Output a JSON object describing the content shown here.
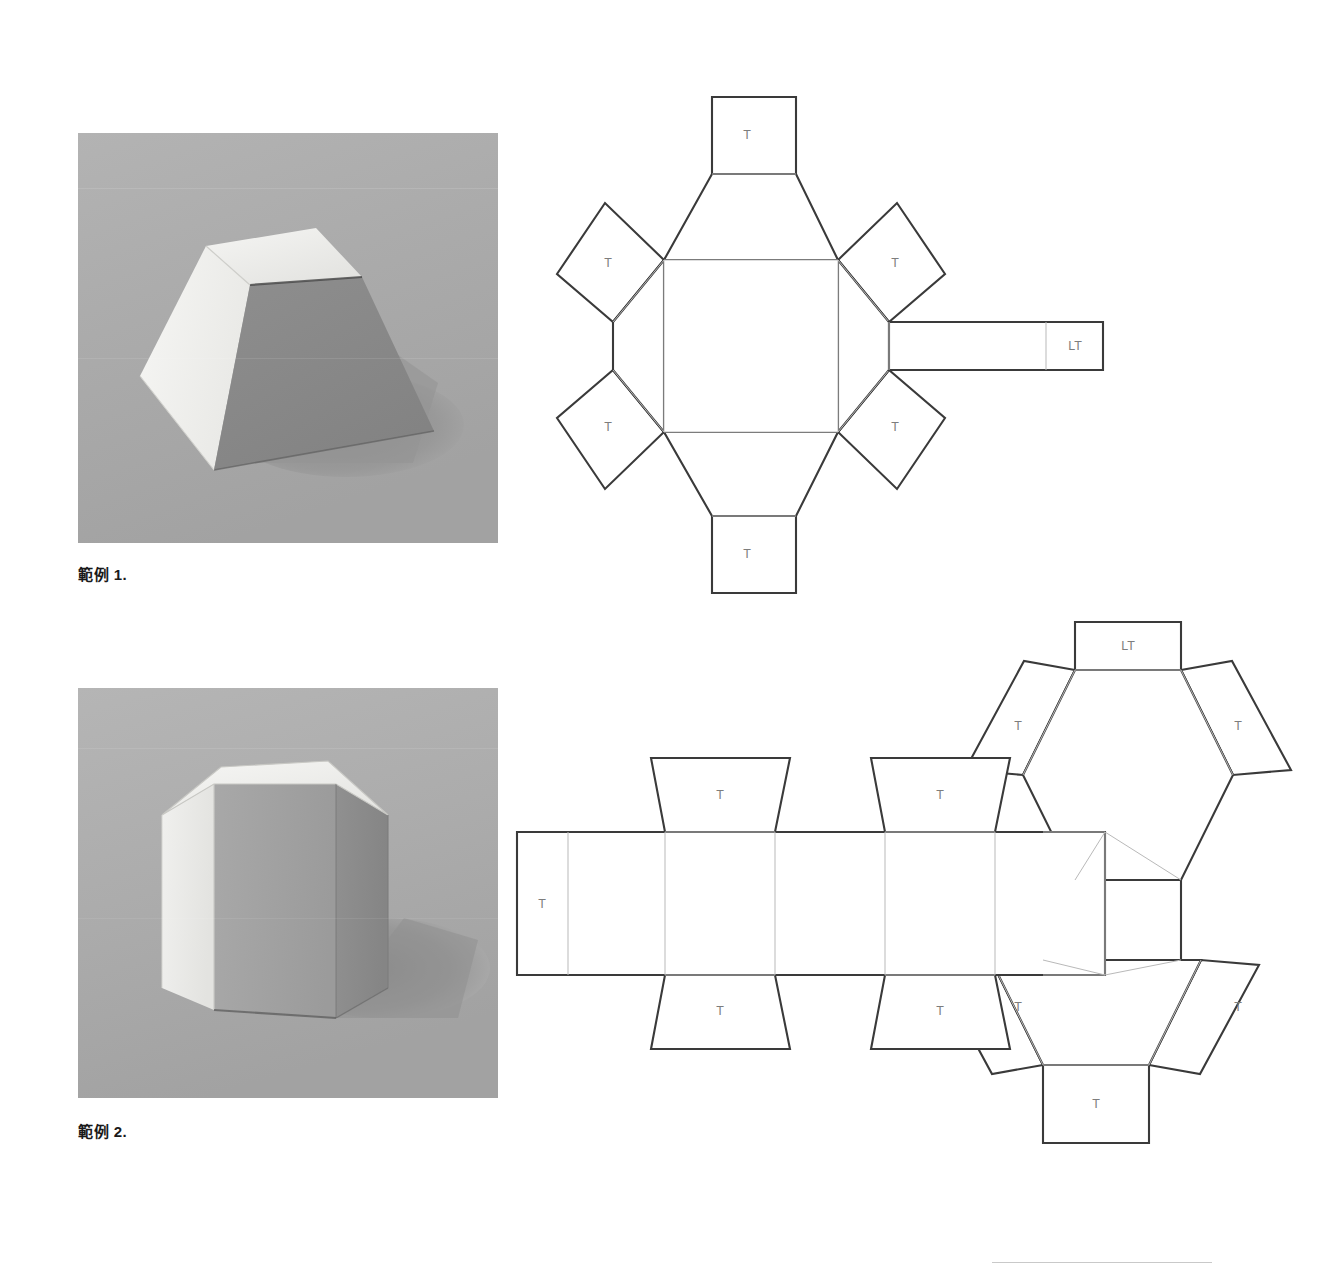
{
  "document": {
    "background_color": "#ffffff",
    "width": 1327,
    "height": 1274
  },
  "examples": [
    {
      "id": "example-1",
      "caption": "範例 1.",
      "caption_text": "範例",
      "caption_number": "1.",
      "photo": {
        "alt_name": "truncated-square-pyramid-photo",
        "shape": "truncated square pyramid (frustum)",
        "background_color": "#a9a9a9",
        "top_face_color": "#ededec",
        "left_face_color": "#f2f2f0",
        "right_face_color": "#8a8a8a",
        "shadow_color": "#949494"
      },
      "net": {
        "name": "truncated-square-pyramid-net",
        "shape_type": "frustum",
        "base_face": "square",
        "side_faces": 4,
        "tabs": [
          {
            "label": "T",
            "position": "top"
          },
          {
            "label": "T",
            "position": "bottom"
          },
          {
            "label": "T",
            "position": "upper-left"
          },
          {
            "label": "T",
            "position": "lower-left"
          },
          {
            "label": "T",
            "position": "upper-right"
          },
          {
            "label": "T",
            "position": "lower-right"
          },
          {
            "label": "LT",
            "position": "right-lid-tab"
          }
        ],
        "tab_label": "T",
        "lid_tab_label": "LT"
      }
    },
    {
      "id": "example-2",
      "caption": "範例 2.",
      "caption_text": "範例",
      "caption_number": "2.",
      "photo": {
        "alt_name": "hexagonal-prism-photo",
        "shape": "hexagonal prism",
        "background_color": "#a9a9a9",
        "top_face_color": "#efefed",
        "left_face_color": "#ececeb",
        "right_face_color": "#8e8e8e",
        "front_face_color": "#9f9f9f",
        "shadow_color": "#8d8d8d"
      },
      "net": {
        "name": "hexagonal-prism-net",
        "shape_type": "prism",
        "base_face": "hexagon",
        "side_faces": 6,
        "tabs": [
          {
            "label": "T",
            "position": "strip-left-edge"
          },
          {
            "label": "T",
            "position": "strip-top-1"
          },
          {
            "label": "T",
            "position": "strip-top-2"
          },
          {
            "label": "T",
            "position": "strip-bottom-1"
          },
          {
            "label": "T",
            "position": "strip-bottom-2"
          },
          {
            "label": "T",
            "position": "upper-hexagon-left"
          },
          {
            "label": "T",
            "position": "upper-hexagon-right"
          },
          {
            "label": "LT",
            "position": "upper-hexagon-top"
          },
          {
            "label": "T",
            "position": "lower-hexagon-left"
          },
          {
            "label": "T",
            "position": "lower-hexagon-right"
          },
          {
            "label": "T",
            "position": "lower-hexagon-bottom"
          }
        ],
        "tab_label": "T",
        "lid_tab_label": "LT"
      }
    }
  ],
  "footer_rule": {
    "name": "bottom-hairline",
    "color": "#c9c9c9"
  }
}
